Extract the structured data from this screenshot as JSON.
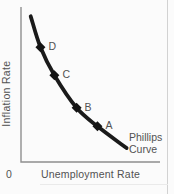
{
  "colors": {
    "background": "#fbfbfb",
    "curve": "#1a1a1a",
    "marker": "#141414",
    "axis": "#8f8f8f",
    "text": "#525252",
    "edge_line": "#d2d2d2"
  },
  "chart": {
    "y_axis_label": "Inflation Rate",
    "x_axis_label": "Unemployment Rate",
    "origin_label": "0",
    "curve_label_line1": "Phillips",
    "curve_label_line2": "Curve"
  },
  "chart_data": {
    "type": "line",
    "title": "Phillips Curve",
    "xlabel": "Unemployment Rate",
    "ylabel": "Inflation Rate",
    "axes_numeric_ticks": false,
    "units": "relative 0-1 fraction of each axis (axes carry no numeric tick labels)",
    "curve_shape": "convex, downward-sloping from upper-left to lower-right",
    "grid": false,
    "legend": "none; curve annotated in-plot as 'Phillips Curve'",
    "series": [
      {
        "name": "Phillips Curve",
        "points": [
          {
            "x": 0.07,
            "y": 0.94
          },
          {
            "x": 0.14,
            "y": 0.74,
            "label": "D"
          },
          {
            "x": 0.24,
            "y": 0.56,
            "label": "C"
          },
          {
            "x": 0.4,
            "y": 0.35,
            "label": "B"
          },
          {
            "x": 0.55,
            "y": 0.23,
            "label": "A"
          },
          {
            "x": 0.76,
            "y": 0.09
          }
        ]
      }
    ]
  }
}
